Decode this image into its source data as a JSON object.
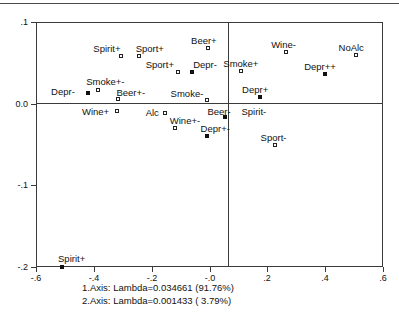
{
  "chart_data": {
    "type": "scatter",
    "title": "",
    "xlabel": "",
    "ylabel": "",
    "xlim": [
      -0.6,
      0.6
    ],
    "ylim": [
      -0.2,
      0.1
    ],
    "grid": false,
    "legend": "none",
    "xticks": [
      "-.6",
      "-.4",
      "-.2",
      "-.0",
      ".2",
      ".4",
      ".6"
    ],
    "xtickvalues": [
      -0.6,
      -0.4,
      -0.2,
      0.0,
      0.2,
      0.4,
      0.6
    ],
    "yticks": [
      ".1",
      "0.0",
      "-.1",
      "-.2"
    ],
    "ytickvalues": [
      0.1,
      0.0,
      -0.1,
      -0.2
    ],
    "marker_styles": [
      "open-square",
      "filled-square"
    ],
    "points": [
      {
        "label": "Spirit+",
        "x": -0.305,
        "y": 0.058,
        "marker": "open",
        "label_dx": -28,
        "label_dy": -12
      },
      {
        "label": "Sport+",
        "x": -0.245,
        "y": 0.058,
        "marker": "open",
        "label_dx": -3,
        "label_dy": -12
      },
      {
        "label": "Beer+",
        "x": -0.005,
        "y": 0.068,
        "marker": "open",
        "label_dx": -17,
        "label_dy": -12
      },
      {
        "label": "Wine-",
        "x": 0.265,
        "y": 0.063,
        "marker": "open",
        "label_dx": -15,
        "label_dy": -12
      },
      {
        "label": "NoAlc",
        "x": 0.505,
        "y": 0.06,
        "marker": "open",
        "label_dx": -17,
        "label_dy": -12
      },
      {
        "label": "Sport+",
        "x": -0.11,
        "y": 0.039,
        "marker": "open",
        "label_dx": -32,
        "label_dy": -12
      },
      {
        "label": "Depr-",
        "x": -0.06,
        "y": 0.039,
        "marker": "filled",
        "label_dx": 1,
        "label_dy": -12
      },
      {
        "label": "Smoke+",
        "x": 0.11,
        "y": 0.04,
        "marker": "open",
        "label_dx": -18,
        "label_dy": -12
      },
      {
        "label": "Depr++",
        "x": 0.4,
        "y": 0.036,
        "marker": "filled",
        "label_dx": -21,
        "label_dy": -12
      },
      {
        "label": "Smoke+-",
        "x": -0.385,
        "y": 0.017,
        "marker": "open",
        "label_dx": -12,
        "label_dy": -13
      },
      {
        "label": "Depr-",
        "x": -0.42,
        "y": 0.013,
        "marker": "filled",
        "label_dx": -37,
        "label_dy": -6
      },
      {
        "label": "Beer+-",
        "x": -0.315,
        "y": 0.006,
        "marker": "open",
        "label_dx": -2,
        "label_dy": -11
      },
      {
        "label": "Depr+",
        "x": 0.175,
        "y": 0.008,
        "marker": "filled",
        "label_dx": -18,
        "label_dy": -12
      },
      {
        "label": "Smoke-",
        "x": -0.01,
        "y": 0.004,
        "marker": "open",
        "label_dx": -36,
        "label_dy": -11
      },
      {
        "label": "Wine+",
        "x": -0.32,
        "y": -0.009,
        "marker": "open",
        "label_dx": -35,
        "label_dy": -4
      },
      {
        "label": "Alc",
        "x": -0.155,
        "y": -0.012,
        "marker": "open",
        "label_dx": -19,
        "label_dy": -5
      },
      {
        "label": "Beer-",
        "x": 0.055,
        "y": -0.016,
        "marker": "filled",
        "label_dx": -18,
        "label_dy": -10
      },
      {
        "label": "Spirit-",
        "x": 0.1,
        "y": -0.016,
        "marker": "none",
        "label_dx": 3,
        "label_dy": -10
      },
      {
        "label": "Wine+-",
        "x": -0.12,
        "y": -0.03,
        "marker": "open",
        "label_dx": -5,
        "label_dy": -12
      },
      {
        "label": "Depr+-",
        "x": -0.01,
        "y": -0.04,
        "marker": "filled",
        "label_dx": -6,
        "label_dy": -12
      },
      {
        "label": "Sport-",
        "x": 0.225,
        "y": -0.05,
        "marker": "open",
        "label_dx": -14,
        "label_dy": -12
      },
      {
        "label": "Spirit+",
        "x": -0.51,
        "y": -0.2,
        "marker": "filled",
        "label_dx": -4,
        "label_dy": -13
      }
    ],
    "annotations": [
      "1.Axis: Lambda=0.034661 (91.76%)",
      "2.Axis: Lambda=0.001433 ( 3.79%)"
    ]
  },
  "caption": {
    "axis1": "1.Axis: Lambda=0.034661 (91.76%)",
    "axis2": "2.Axis: Lambda=0.001433 ( 3.79%)"
  }
}
